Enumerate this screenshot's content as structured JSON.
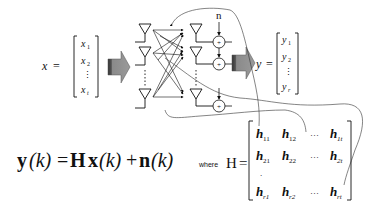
{
  "input_vector": {
    "label": "x",
    "equals": "=",
    "entries": [
      {
        "base": "x",
        "sub": "1"
      },
      {
        "base": "x",
        "sub": "2"
      },
      {
        "base": "⋮",
        "sub": ""
      },
      {
        "base": "x",
        "sub": "t"
      }
    ]
  },
  "output_vector": {
    "label": "y",
    "equals": "=",
    "entries": [
      {
        "base": "y",
        "sub": "1"
      },
      {
        "base": "y",
        "sub": "2"
      },
      {
        "base": "⋮",
        "sub": ""
      },
      {
        "base": "y",
        "sub": "r"
      }
    ]
  },
  "noise_label": "n",
  "adder_symbol": "+",
  "equation": {
    "lhs": "y",
    "lhs_arg": "(k)",
    "eq": "=",
    "H": "H",
    "x": "x",
    "x_arg": "(k)",
    "plus": "+",
    "n": "n",
    "n_arg": "(k)"
  },
  "where_label": "where",
  "matrix": {
    "name": "H",
    "equals": "=",
    "rows": [
      [
        {
          "b": "h",
          "s": "11"
        },
        {
          "b": "h",
          "s": "12"
        },
        {
          "b": "…",
          "s": ""
        },
        {
          "b": "h",
          "s": "1t"
        }
      ],
      [
        {
          "b": "h",
          "s": "21"
        },
        {
          "b": "h",
          "s": "22"
        },
        {
          "b": "…",
          "s": ""
        },
        {
          "b": "h",
          "s": "2t"
        }
      ],
      [
        {
          "b": ".",
          "s": ""
        },
        {
          "b": "",
          "s": ""
        },
        {
          "b": "",
          "s": ""
        },
        {
          "b": "",
          "s": ""
        }
      ],
      [
        {
          "b": "h",
          "s": "r1"
        },
        {
          "b": "h",
          "s": "r2"
        },
        {
          "b": "…",
          "s": ""
        },
        {
          "b": "h",
          "s": "rt"
        }
      ]
    ]
  },
  "colors": {
    "ink": "#111111",
    "arrow_fill": "#8a8a8a",
    "arrow_dark": "#444444",
    "curve": "#333333"
  }
}
